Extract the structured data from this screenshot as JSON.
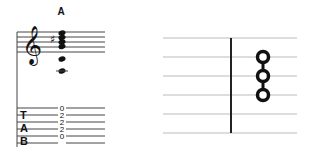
{
  "notation": {
    "chord_name": "A",
    "staff": {
      "clef": "treble",
      "accidental": "sharp",
      "notes": [
        "A3",
        "E4",
        "A4",
        "C#5",
        "E5"
      ]
    },
    "tab": {
      "labels": [
        "T",
        "A",
        "B"
      ],
      "frets": [
        "0",
        "2",
        "2",
        "2",
        "0"
      ]
    }
  },
  "fretboard": {
    "strings": 6,
    "fretted_dots": 3,
    "fret_positions": [
      "2",
      "2",
      "2"
    ]
  }
}
